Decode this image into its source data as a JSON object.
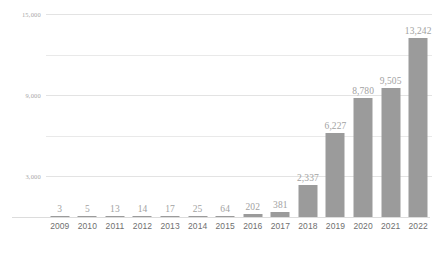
{
  "chart_data": {
    "type": "bar",
    "title": "",
    "subtitle": "",
    "xlabel": "",
    "ylabel": "",
    "categories": [
      "2009",
      "2010",
      "2011",
      "2012",
      "2013",
      "2014",
      "2015",
      "2016",
      "2017",
      "2018",
      "2019",
      "2020",
      "2021",
      "2022"
    ],
    "values": [
      3,
      5,
      13,
      14,
      17,
      25,
      64,
      202,
      381,
      2337,
      6227,
      8780,
      9505,
      13242
    ],
    "value_labels": [
      "3",
      "5",
      "13",
      "14",
      "17",
      "25",
      "64",
      "202",
      "381",
      "2,337",
      "6,227",
      "8,780",
      "9,505",
      "13,242"
    ],
    "ylim": [
      0,
      15000
    ],
    "y_gridlines": [
      3000,
      6000,
      9000,
      12000,
      15000
    ],
    "y_tick_labels": [
      {
        "value": 15000,
        "label": "15,000"
      },
      {
        "value": 12000,
        "label": ""
      },
      {
        "value": 9000,
        "label": "9,000"
      },
      {
        "value": 6000,
        "label": ""
      },
      {
        "value": 3000,
        "label": "3,000"
      }
    ],
    "grid": true,
    "legend": false,
    "legend_position": "none",
    "colors": {
      "bar": "#9b9b9b",
      "gridline": "#e9e9e9",
      "axis_line": "#dcdcdc",
      "value_label": "#a2a2a2",
      "tick_label": "#a8a8a8",
      "category_label": "#6f6f6f",
      "background": "#ffffff"
    }
  }
}
